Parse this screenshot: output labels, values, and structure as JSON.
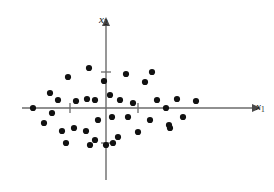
{
  "figure": {
    "type": "scatter-plot",
    "width": 274,
    "height": 192,
    "background": "#ffffff",
    "axis_color": "#6b6b6b",
    "point_color": "#111111"
  },
  "axes": {
    "x": {
      "label": "x",
      "label_sub": "1",
      "origin_px": 108,
      "start_px": 22,
      "end_px": 252,
      "arrow": "right",
      "ticks_px": [
        70,
        138
      ]
    },
    "y": {
      "label": "x",
      "label_sub": "2",
      "origin_px": 106,
      "start_px": 180,
      "end_px": 26,
      "arrow": "up",
      "ticks_px": [
        72,
        143
      ]
    }
  },
  "chart_data": {
    "type": "scatter",
    "title": "",
    "xlabel": "x1",
    "ylabel": "x2",
    "grid": false,
    "legend": null,
    "xlim": [
      -2.5,
      2.5
    ],
    "ylim": [
      -1.6,
      1.6
    ],
    "n_points": 38,
    "units": "data-units (origin at axis crossing; tick spacing = 1 unit)",
    "px_per_unit_x": 36,
    "px_per_unit_y": 36,
    "points_px": [
      [
        89,
        68
      ],
      [
        104,
        81
      ],
      [
        68,
        77
      ],
      [
        50,
        93
      ],
      [
        58,
        100
      ],
      [
        76,
        101
      ],
      [
        87,
        99
      ],
      [
        126,
        74
      ],
      [
        152,
        72
      ],
      [
        145,
        82
      ],
      [
        110,
        95
      ],
      [
        120,
        100
      ],
      [
        157,
        100
      ],
      [
        177,
        99
      ],
      [
        33,
        108
      ],
      [
        52,
        113
      ],
      [
        95,
        100
      ],
      [
        74,
        128
      ],
      [
        86,
        131
      ],
      [
        66,
        143
      ],
      [
        90,
        145
      ],
      [
        95,
        140
      ],
      [
        112,
        117
      ],
      [
        128,
        117
      ],
      [
        150,
        120
      ],
      [
        169,
        125
      ],
      [
        183,
        117
      ],
      [
        138,
        132
      ],
      [
        113,
        143
      ],
      [
        106,
        145
      ],
      [
        170,
        128
      ],
      [
        44,
        123
      ],
      [
        62,
        131
      ],
      [
        98,
        120
      ],
      [
        133,
        103
      ],
      [
        166,
        108
      ],
      [
        196,
        101
      ],
      [
        118,
        137
      ]
    ],
    "points": [
      [
        -0.47,
        1.11
      ],
      [
        -0.06,
        0.75
      ],
      [
        -1.11,
        0.86
      ],
      [
        -1.56,
        0.42
      ],
      [
        -1.33,
        0.22
      ],
      [
        -0.83,
        0.19
      ],
      [
        -0.53,
        0.25
      ],
      [
        0.5,
        0.94
      ],
      [
        1.22,
        1.0
      ],
      [
        1.08,
        0.72
      ],
      [
        0.11,
        0.36
      ],
      [
        0.39,
        0.22
      ],
      [
        1.42,
        0.22
      ],
      [
        1.97,
        0.25
      ],
      [
        -2.03,
        0.0
      ],
      [
        -1.5,
        -0.14
      ],
      [
        -0.31,
        0.22
      ],
      [
        -0.89,
        -0.56
      ],
      [
        -0.56,
        -0.64
      ],
      [
        -1.11,
        -0.97
      ],
      [
        -0.44,
        -1.03
      ],
      [
        -0.31,
        -0.89
      ],
      [
        0.17,
        -0.25
      ],
      [
        0.61,
        -0.25
      ],
      [
        1.22,
        -0.33
      ],
      [
        1.75,
        -0.47
      ],
      [
        2.14,
        -0.25
      ],
      [
        0.89,
        -0.67
      ],
      [
        0.19,
        -0.97
      ],
      [
        0.0,
        -1.03
      ],
      [
        1.78,
        -0.56
      ],
      [
        -1.72,
        -0.42
      ],
      [
        -1.22,
        -0.64
      ],
      [
        -0.22,
        -0.33
      ],
      [
        0.75,
        0.14
      ],
      [
        1.61,
        0.0
      ],
      [
        2.44,
        0.19
      ],
      [
        0.33,
        -0.81
      ]
    ]
  }
}
